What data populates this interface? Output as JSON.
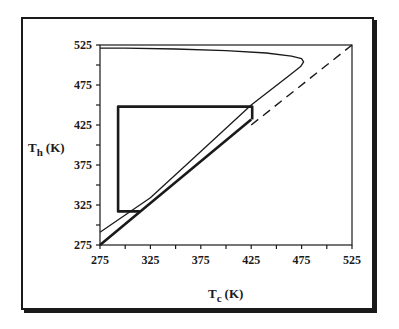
{
  "chart_data": {
    "type": "line",
    "title": "",
    "xlabel": "T_c (K)",
    "xlabel_main": "T",
    "xlabel_sub": "c",
    "xlabel_unit": "(K)",
    "ylabel": "T_h (K)",
    "ylabel_main": "T",
    "ylabel_sub": "h",
    "ylabel_unit": "(K)",
    "xlim": [
      275,
      525
    ],
    "ylim": [
      275,
      525
    ],
    "xticks": [
      "275",
      "325",
      "375",
      "425",
      "475",
      "525"
    ],
    "yticks": [
      "275",
      "325",
      "375",
      "425",
      "475",
      "525"
    ],
    "grid": false,
    "legend": null,
    "series": [
      {
        "name": "closed boundary curve",
        "style": "solid thin",
        "x": [
          275,
          300,
          350,
          400,
          440,
          465,
          475,
          477,
          474,
          465,
          425,
          375,
          325,
          275
        ],
        "y": [
          521,
          521,
          520,
          518,
          515,
          511,
          508,
          504,
          498,
          489,
          450,
          392,
          334,
          291
        ]
      },
      {
        "name": "lower boundary line",
        "style": "solid bold",
        "x": [
          275,
          315,
          425
        ],
        "y": [
          275,
          317,
          432
        ]
      },
      {
        "name": "rectangle (operating region)",
        "style": "solid bold",
        "x": [
          315,
          293,
          293,
          426,
          426
        ],
        "y": [
          317,
          317,
          448,
          448,
          432
        ]
      },
      {
        "name": "T_h = T_c (dashed)",
        "style": "dashed",
        "x": [
          425,
          525
        ],
        "y": [
          425,
          525
        ]
      }
    ]
  }
}
